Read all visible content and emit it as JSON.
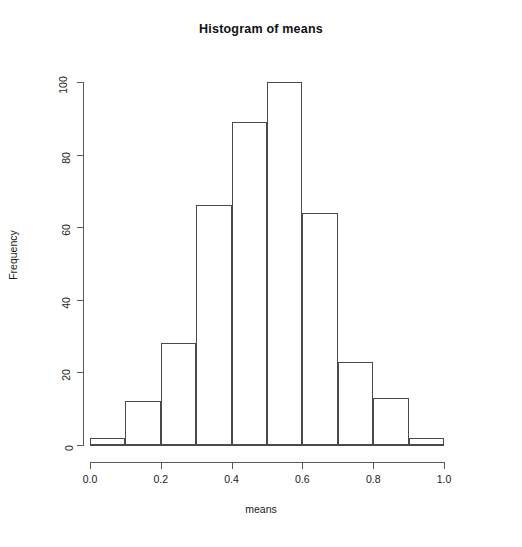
{
  "chart_data": {
    "type": "bar",
    "title": "Histogram of means",
    "xlabel": "means",
    "ylabel": "Frequency",
    "grid": false,
    "legend": null,
    "xlim": [
      0.0,
      1.0
    ],
    "ylim": [
      0,
      100
    ],
    "bin_width": 0.1,
    "bin_edges": [
      0.0,
      0.1,
      0.2,
      0.3,
      0.4,
      0.5,
      0.6,
      0.7,
      0.8,
      0.9,
      1.0
    ],
    "categories": [
      "0.0-0.1",
      "0.1-0.2",
      "0.2-0.3",
      "0.3-0.4",
      "0.4-0.5",
      "0.5-0.6",
      "0.6-0.7",
      "0.7-0.8",
      "0.8-0.9",
      "0.9-1.0"
    ],
    "values": [
      2,
      12,
      28,
      66,
      89,
      100,
      64,
      23,
      13,
      2
    ],
    "xticks": [
      0.0,
      0.2,
      0.4,
      0.6,
      0.8,
      1.0
    ],
    "xtick_labels": [
      "0.0",
      "0.2",
      "0.4",
      "0.6",
      "0.8",
      "1.0"
    ],
    "yticks": [
      0,
      20,
      40,
      60,
      80,
      100
    ],
    "ytick_labels": [
      "0",
      "20",
      "40",
      "60",
      "80",
      "100"
    ],
    "bar_color": "#ffffff",
    "bar_border_color": "#4a4a4a",
    "axis_color": "#5a5a5a",
    "background": "#ffffff"
  }
}
